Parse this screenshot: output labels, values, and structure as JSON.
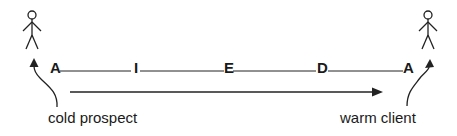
{
  "diagram": {
    "stages": [
      {
        "letter": "A",
        "x": 50
      },
      {
        "letter": "I",
        "x": 134
      },
      {
        "letter": "E",
        "x": 224
      },
      {
        "letter": "D",
        "x": 317
      },
      {
        "letter": "A",
        "x": 403
      }
    ],
    "left_caption": "cold prospect",
    "right_caption": "warm client",
    "colors": {
      "ink": "#1a1a1a",
      "background": "#ffffff"
    }
  }
}
